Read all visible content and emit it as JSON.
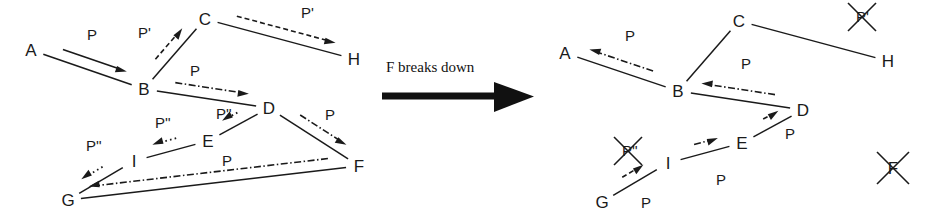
{
  "diagram": {
    "title_visible": false,
    "transition": {
      "label": "F breaks down",
      "arrow": "right-arrow-icon"
    },
    "colors": {
      "ink": "#1a1a1a",
      "background": "#ffffff"
    },
    "panels": [
      {
        "id": "before",
        "nodes": [
          {
            "id": "A",
            "label": "A",
            "x": 31,
            "y": 50,
            "crossed": false
          },
          {
            "id": "B",
            "label": "B",
            "x": 144,
            "y": 89,
            "crossed": false
          },
          {
            "id": "C",
            "label": "C",
            "x": 205,
            "y": 19,
            "crossed": false
          },
          {
            "id": "D",
            "label": "D",
            "x": 269,
            "y": 108,
            "crossed": false
          },
          {
            "id": "E",
            "label": "E",
            "x": 208,
            "y": 141,
            "crossed": false
          },
          {
            "id": "F",
            "label": "F",
            "x": 359,
            "y": 166,
            "crossed": false
          },
          {
            "id": "G",
            "label": "G",
            "x": 68,
            "y": 200,
            "crossed": false
          },
          {
            "id": "H",
            "label": "H",
            "x": 354,
            "y": 59,
            "crossed": false
          },
          {
            "id": "I",
            "label": "I",
            "x": 134,
            "y": 161,
            "crossed": false
          }
        ],
        "edges": [
          {
            "from": "A",
            "to": "B"
          },
          {
            "from": "B",
            "to": "C"
          },
          {
            "from": "C",
            "to": "H"
          },
          {
            "from": "B",
            "to": "D"
          },
          {
            "from": "D",
            "to": "E"
          },
          {
            "from": "E",
            "to": "I"
          },
          {
            "from": "I",
            "to": "G"
          },
          {
            "from": "G",
            "to": "F"
          },
          {
            "from": "D",
            "to": "F"
          }
        ],
        "flows": [
          {
            "id": "ab",
            "label": "P",
            "from": "A",
            "to": "B",
            "style": "solid",
            "label_x": 87,
            "label_y": 40,
            "crossed": false
          },
          {
            "id": "bc",
            "label": "P'",
            "from": "B",
            "to": "C",
            "style": "dashed",
            "label_x": 138,
            "label_y": 38,
            "crossed": false
          },
          {
            "id": "ch",
            "label": "P'",
            "from": "C",
            "to": "H",
            "style": "dashed",
            "label_x": 301,
            "label_y": 18,
            "crossed": false
          },
          {
            "id": "bd",
            "label": "P",
            "from": "B",
            "to": "D",
            "style": "dashdot",
            "label_x": 190,
            "label_y": 76,
            "crossed": false
          },
          {
            "id": "de",
            "label": "P''",
            "from": "D",
            "to": "E",
            "style": "dotted",
            "label_x": 216,
            "label_y": 119,
            "crossed": false
          },
          {
            "id": "ei",
            "label": "P''",
            "from": "E",
            "to": "I",
            "style": "dotted",
            "label_x": 155,
            "label_y": 128,
            "crossed": false
          },
          {
            "id": "ig",
            "label": "P''",
            "from": "I",
            "to": "G",
            "style": "dotted",
            "label_x": 86,
            "label_y": 151,
            "crossed": false
          },
          {
            "id": "fg",
            "label": "P",
            "from": "F",
            "to": "G",
            "style": "dashdot",
            "label_x": 222,
            "label_y": 166,
            "crossed": false
          },
          {
            "id": "df",
            "label": "P",
            "from": "D",
            "to": "F",
            "style": "dashdot",
            "label_x": 325,
            "label_y": 120,
            "crossed": false
          }
        ]
      },
      {
        "id": "after",
        "nodes": [
          {
            "id": "A",
            "label": "A",
            "x": 565,
            "y": 53,
            "crossed": false
          },
          {
            "id": "B",
            "label": "B",
            "x": 678,
            "y": 91,
            "crossed": false
          },
          {
            "id": "C",
            "label": "C",
            "x": 739,
            "y": 21,
            "crossed": false
          },
          {
            "id": "D",
            "label": "D",
            "x": 803,
            "y": 110,
            "crossed": false
          },
          {
            "id": "E",
            "label": "E",
            "x": 742,
            "y": 143,
            "crossed": false
          },
          {
            "id": "F",
            "label": "F",
            "x": 893,
            "y": 168,
            "crossed": true
          },
          {
            "id": "G",
            "label": "G",
            "x": 602,
            "y": 202,
            "crossed": false
          },
          {
            "id": "H",
            "label": "H",
            "x": 888,
            "y": 61,
            "crossed": false
          },
          {
            "id": "I",
            "label": "I",
            "x": 668,
            "y": 163,
            "crossed": false
          }
        ],
        "edges": [
          {
            "from": "A",
            "to": "B"
          },
          {
            "from": "B",
            "to": "C"
          },
          {
            "from": "C",
            "to": "H"
          },
          {
            "from": "B",
            "to": "D"
          },
          {
            "from": "D",
            "to": "E"
          },
          {
            "from": "E",
            "to": "I"
          },
          {
            "from": "I",
            "to": "G"
          }
        ],
        "flows": [
          {
            "id": "ba",
            "label": "P",
            "from": "B",
            "to": "A",
            "style": "dashdot",
            "label_x": 625,
            "label_y": 41,
            "crossed": false
          },
          {
            "id": "ch",
            "label": "P'",
            "from": "C",
            "to": "H",
            "style": "none",
            "label_x": 856,
            "label_y": 22,
            "crossed": true
          },
          {
            "id": "db",
            "label": "P",
            "from": "D",
            "to": "B",
            "style": "dashdot",
            "label_x": 741,
            "label_y": 69,
            "crossed": false
          },
          {
            "id": "ed",
            "label": "P",
            "from": "E",
            "to": "D",
            "style": "dashed",
            "label_x": 785,
            "label_y": 139,
            "crossed": false
          },
          {
            "id": "ie",
            "label": "P",
            "from": "I",
            "to": "E",
            "style": "dashdot",
            "label_x": 716,
            "label_y": 185,
            "crossed": false
          },
          {
            "id": "gi",
            "label": "P",
            "from": "G",
            "to": "I",
            "style": "dashed",
            "label_x": 641,
            "label_y": 208,
            "crossed": false
          },
          {
            "id": "ig_old",
            "label": "P''",
            "from": "I",
            "to": "G",
            "style": "none",
            "label_x": 622,
            "label_y": 156,
            "crossed": true
          }
        ]
      }
    ]
  }
}
